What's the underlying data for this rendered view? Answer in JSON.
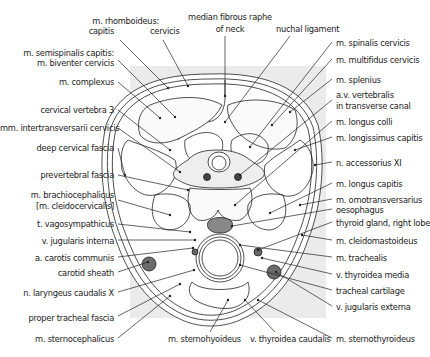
{
  "diagram": {
    "type": "anatomical cross-section",
    "colors": {
      "background_panel": "#ebebeb",
      "line": "#222222",
      "vessel_fill": "#6b6b6b",
      "spinal_cord_fill": "#ffffff",
      "muscle_fill": "#f8f8f8"
    },
    "labels_top": [
      {
        "id": "rhomboideus",
        "text": "m. rhomboideus:"
      },
      {
        "id": "rhomboideus-capitis",
        "text": "capitis"
      },
      {
        "id": "rhomboideus-cervicis",
        "text": "cervicis"
      },
      {
        "id": "median-raphe-1",
        "text": "median fibrous raphe"
      },
      {
        "id": "median-raphe-2",
        "text": "of neck"
      },
      {
        "id": "nuchal-ligament",
        "text": "nuchal ligament"
      }
    ],
    "labels_left": [
      {
        "id": "semispinalis-1",
        "text": "m. semispinalis capitis:"
      },
      {
        "id": "semispinalis-2",
        "text": "m. biventer cervicis"
      },
      {
        "id": "complexus",
        "text": "m. complexus"
      },
      {
        "id": "cervical-vertebra",
        "text": "cervical vertebra 3"
      },
      {
        "id": "intertransversarii",
        "text": "mm. intertransversarii cervicis"
      },
      {
        "id": "deep-cervical-fascia",
        "text": "deep cervical fascia"
      },
      {
        "id": "prevertebral-fascia",
        "text": "prevertebral fascia"
      },
      {
        "id": "brachiocephalicus-1",
        "text": "m. brachiocephalicus"
      },
      {
        "id": "brachiocephalicus-2",
        "text": "[m. cleidocervicalis]"
      },
      {
        "id": "vagosympathicus",
        "text": "t. vagosympathicus"
      },
      {
        "id": "jugularis-interna",
        "text": "v. jugularis interna"
      },
      {
        "id": "carotis-communis",
        "text": "a. carotis communis"
      },
      {
        "id": "carotid-sheath",
        "text": "carotid sheath"
      },
      {
        "id": "laryngeus",
        "text": "n. laryngeus caudalis X"
      },
      {
        "id": "tracheal-fascia",
        "text": "proper tracheal fascia"
      },
      {
        "id": "sternocephalicus",
        "text": "m. sternocephalicus"
      }
    ],
    "labels_right": [
      {
        "id": "spinalis",
        "text": "m. spinalis cervicis"
      },
      {
        "id": "multifidus",
        "text": "m. multifidus cervicis"
      },
      {
        "id": "splenius",
        "text": "m. splenius"
      },
      {
        "id": "vertebralis-1",
        "text": "a.v. vertebralis"
      },
      {
        "id": "vertebralis-2",
        "text": "in transverse canal"
      },
      {
        "id": "longus-colli",
        "text": "m. longus colli"
      },
      {
        "id": "longissimus",
        "text": "m. longissimus capitis"
      },
      {
        "id": "accessorius",
        "text": "n. accessorius XI"
      },
      {
        "id": "longus-capitis",
        "text": "m. longus capitis"
      },
      {
        "id": "omotransversarius",
        "text": "m. omotransversarius"
      },
      {
        "id": "oesophagus",
        "text": "oesophagus"
      },
      {
        "id": "thyroid",
        "text": "thyroid gland, right lobe"
      },
      {
        "id": "cleidomastoideus",
        "text": "m. cleidomastoideus"
      },
      {
        "id": "trachealis",
        "text": "m. trachealis"
      },
      {
        "id": "thyroidea-media",
        "text": "v. thyroidea media"
      },
      {
        "id": "tracheal-cartilage",
        "text": "tracheal cartilage"
      },
      {
        "id": "jugularis-externa",
        "text": "v. jugularis externa"
      },
      {
        "id": "sternothyroideus",
        "text": "m. sternothyroideus"
      }
    ],
    "labels_bottom": [
      {
        "id": "sternohyoideus",
        "text": "m. sternohyoideus"
      },
      {
        "id": "thyroidea-caudalis",
        "text": "v. thyroidea caudalis"
      }
    ]
  }
}
